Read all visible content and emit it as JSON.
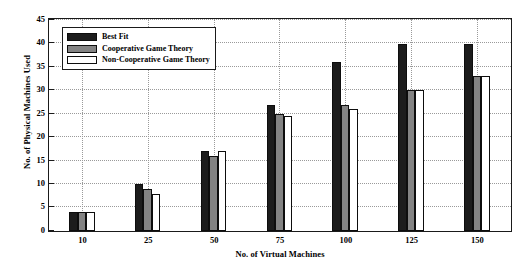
{
  "chart_data": {
    "type": "bar",
    "title": "",
    "xlabel": "No. of Virtual Machines",
    "ylabel": "No. of Physical Machines Used",
    "categories": [
      "10",
      "25",
      "50",
      "75",
      "100",
      "125",
      "150"
    ],
    "series": [
      {
        "name": "Best Fit",
        "color": "#1c1c1c",
        "values": [
          4,
          10,
          17,
          27,
          36,
          40,
          40
        ]
      },
      {
        "name": "Cooperative Game Theory",
        "color": "#838383",
        "values": [
          4,
          9,
          16,
          25,
          27,
          30,
          33
        ]
      },
      {
        "name": "Non-Cooperative Game Theory",
        "color": "#ffffff",
        "values": [
          4,
          8,
          17,
          24.5,
          26,
          30,
          33
        ]
      }
    ],
    "ylim": [
      0,
      45
    ],
    "yticks": [
      0,
      5,
      10,
      15,
      20,
      25,
      30,
      35,
      40,
      45
    ],
    "ytick_labels": [
      "0",
      "5",
      "10",
      "15",
      "20",
      "25",
      "30",
      "35",
      "40",
      "45"
    ],
    "grid": true,
    "legend_position": "upper left"
  }
}
